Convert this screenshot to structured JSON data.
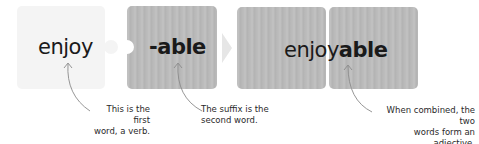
{
  "diagram": {
    "pieces": [
      {
        "id": "first-word",
        "text": "enjoy",
        "style": "light"
      },
      {
        "id": "suffix",
        "text": "-able",
        "style": "wood"
      },
      {
        "id": "combined",
        "base": "enjoy",
        "suffix": "able",
        "style": "wood"
      }
    ],
    "annotations": [
      {
        "target": "first-word",
        "line1": "This is the first",
        "line2": "word, a verb."
      },
      {
        "target": "suffix",
        "line1": "The suffix is the",
        "line2": "second word."
      },
      {
        "target": "combined",
        "line1": "When combined, the two",
        "line2": "words form an adjective."
      }
    ],
    "connector": "arrow-right",
    "colors": {
      "light_piece": "#f4f4f4",
      "wood_piece": "#b9b9b9",
      "text": "#1a1a1a",
      "annotation_line": "#8a8a8a"
    }
  }
}
